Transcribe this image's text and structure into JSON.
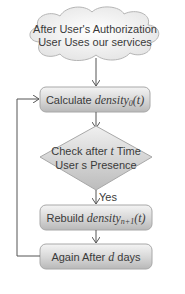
{
  "diagram": {
    "type": "flowchart",
    "nodes": {
      "start": {
        "shape": "cloud",
        "line1": "After User's Authorization",
        "line2": "User Uses our services"
      },
      "calculate": {
        "shape": "rounded-rectangle",
        "label": "Calculate ",
        "var": "density",
        "sub": "0",
        "arg": "(t)"
      },
      "check": {
        "shape": "diamond",
        "line1_pre": "Check after ",
        "line1_var": "t",
        "line1_post": " Time",
        "line2": "User s Presence"
      },
      "rebuild": {
        "shape": "rounded-rectangle",
        "label": "Rebuild ",
        "var": "density",
        "sub": "n+1",
        "arg": "(t)"
      },
      "again": {
        "shape": "rounded-rectangle",
        "label_pre": "Again After ",
        "label_var": "d",
        "label_post": " days"
      }
    },
    "edges": [
      {
        "from": "start",
        "to": "calculate",
        "label": ""
      },
      {
        "from": "calculate",
        "to": "check",
        "label": ""
      },
      {
        "from": "check",
        "to": "rebuild",
        "label": "Yes"
      },
      {
        "from": "rebuild",
        "to": "again",
        "label": ""
      },
      {
        "from": "again",
        "to": "calculate",
        "label": "",
        "style": "loop-left"
      }
    ],
    "colors": {
      "box_fill_top": "#f2f2f2",
      "box_fill_bottom": "#bdbdbd",
      "box_stroke": "#a8a8a8",
      "cloud_fill": "#f7f7f7",
      "cloud_stroke": "#b5b5b5",
      "arrow": "#555555",
      "text": "#3a3a3a"
    }
  }
}
